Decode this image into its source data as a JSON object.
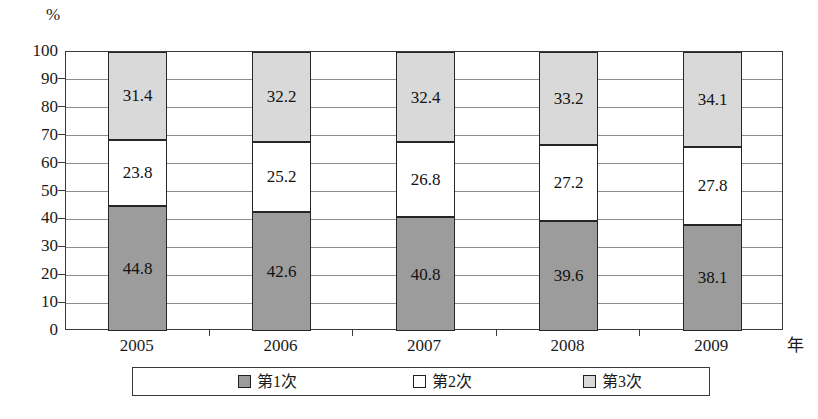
{
  "chart_data": {
    "type": "bar",
    "stacked": true,
    "normalized_percent": true,
    "title": "",
    "xlabel": "年",
    "ylabel": "%",
    "ylim": [
      0,
      100
    ],
    "yticks": [
      0,
      10,
      20,
      30,
      40,
      50,
      60,
      70,
      80,
      90,
      100
    ],
    "grid": true,
    "legend_position": "bottom",
    "categories": [
      "2005",
      "2006",
      "2007",
      "2008",
      "2009"
    ],
    "series": [
      {
        "name": "第1次",
        "color": "#9c9c9c",
        "values": [
          44.8,
          42.6,
          40.8,
          39.6,
          38.1
        ]
      },
      {
        "name": "第2次",
        "color": "#ffffff",
        "values": [
          23.8,
          25.2,
          26.8,
          27.2,
          27.8
        ]
      },
      {
        "name": "第3次",
        "color": "#d9d9d9",
        "values": [
          31.4,
          32.2,
          32.4,
          33.2,
          34.1
        ]
      }
    ]
  },
  "axis": {
    "unit_label": "%",
    "x_title": "年",
    "y_tick_labels": [
      "100",
      "90",
      "80",
      "70",
      "60",
      "50",
      "40",
      "30",
      "20",
      "10",
      "0"
    ],
    "x_tick_labels": [
      "2005",
      "2006",
      "2007",
      "2008",
      "2009"
    ]
  },
  "legend": {
    "items": [
      {
        "label": "第1次",
        "swatch": "dark-gray-swatch-icon"
      },
      {
        "label": "第2次",
        "swatch": "white-swatch-icon"
      },
      {
        "label": "第3次",
        "swatch": "light-gray-swatch-icon"
      }
    ]
  },
  "data_labels": {
    "s1": [
      "44.8",
      "42.6",
      "40.8",
      "39.6",
      "38.1"
    ],
    "s2": [
      "23.8",
      "25.2",
      "26.8",
      "27.2",
      "27.8"
    ],
    "s3": [
      "31.4",
      "32.2",
      "32.4",
      "33.2",
      "34.1"
    ]
  }
}
